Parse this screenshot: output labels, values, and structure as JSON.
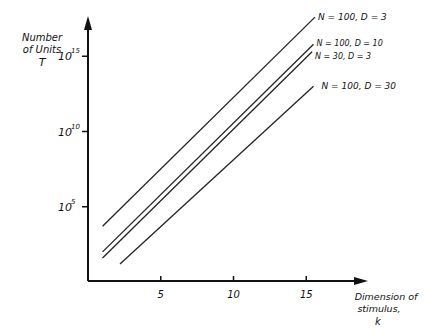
{
  "chart_data": {
    "type": "line",
    "title": "",
    "ylabel": [
      "Number",
      "of Units",
      "T"
    ],
    "xlabel": [
      "Dimension of",
      "stimulus,",
      "k"
    ],
    "yscale": "log",
    "y_ticks": [
      {
        "label_base": "10",
        "label_exp": "5",
        "log_value": 5
      },
      {
        "label_base": "10",
        "label_exp": "10",
        "log_value": 10
      },
      {
        "label_base": "10",
        "label_exp": "15",
        "log_value": 15
      }
    ],
    "x_ticks": [
      {
        "label": "5",
        "value": 5
      },
      {
        "label": "10",
        "value": 10
      },
      {
        "label": "15",
        "value": 15
      }
    ],
    "xlim": [
      0,
      19.5
    ],
    "ylim_log10": [
      0,
      18.5
    ],
    "grid": false,
    "legend_position": "inline labels at right end of lines",
    "series": [
      {
        "name": "N = 100, D = 3",
        "x": [
          1.0,
          15.6
        ],
        "log10_y": [
          3.7,
          17.6
        ]
      },
      {
        "name": "N = 100, D = 10",
        "x": [
          1.0,
          15.5
        ],
        "log10_y": [
          2.0,
          15.8
        ]
      },
      {
        "name": "N = 30, D = 3",
        "x": [
          1.0,
          15.4
        ],
        "log10_y": [
          1.6,
          15.3
        ]
      },
      {
        "name": "N = 100, D = 30",
        "x": [
          2.2,
          15.5
        ],
        "log10_y": [
          1.2,
          13.0
        ]
      }
    ]
  }
}
